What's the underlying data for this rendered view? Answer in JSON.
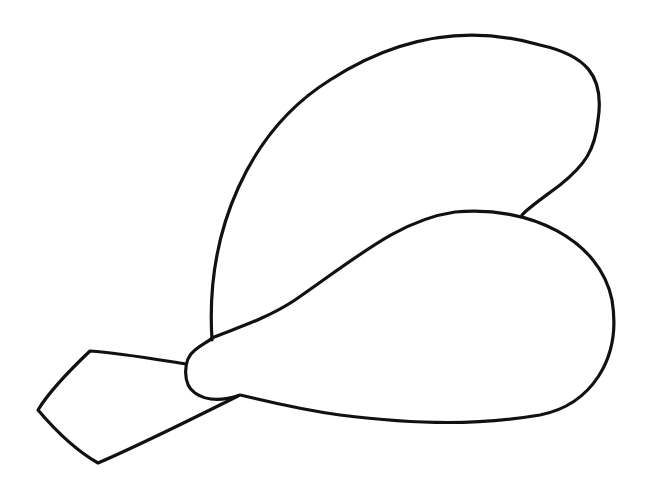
{
  "drawing": {
    "subject": "leaf-like line drawing",
    "stroke_color": "#111111",
    "background": "#ffffff"
  }
}
